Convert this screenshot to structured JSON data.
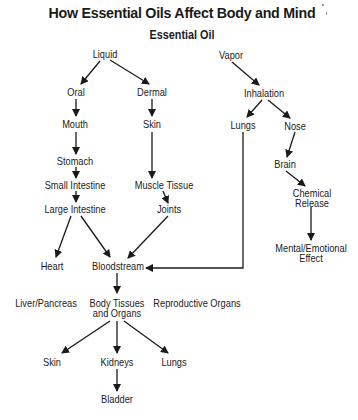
{
  "title": "How Essential Oils Affect Body and Mind",
  "subtitle": "Essential Oil",
  "nodes": {
    "liquid": "Liquid",
    "vapor": "Vapor",
    "oral": "Oral",
    "dermal": "Dermal",
    "inhalation": "Inhalation",
    "mouth": "Mouth",
    "skin_dermal": "Skin",
    "lungs_inhalation": "Lungs",
    "nose": "Nose",
    "stomach": "Stomach",
    "brain": "Brain",
    "small_intestine": "Small Intestine",
    "muscle_tissue": "Muscle Tissue",
    "large_intestine": "Large Intestine",
    "joints": "Joints",
    "chemical_release_1": "Chemical",
    "chemical_release_2": "Release",
    "mental_effect_1": "Mental/Emotional",
    "mental_effect_2": "Effect",
    "heart": "Heart",
    "bloodstream": "Bloodstream",
    "liver_pancreas": "Liver/Pancreas",
    "body_tissues_1": "Body Tissues",
    "body_tissues_2": "and Organs",
    "reproductive_organs": "Reproductive Organs",
    "skin_output": "Skin",
    "kidneys": "Kidneys",
    "lungs_output": "Lungs",
    "bladder": "Bladder"
  },
  "edges": [
    [
      "Liquid",
      "Oral"
    ],
    [
      "Liquid",
      "Dermal"
    ],
    [
      "Vapor",
      "Inhalation"
    ],
    [
      "Oral",
      "Mouth"
    ],
    [
      "Dermal",
      "Skin"
    ],
    [
      "Inhalation",
      "Lungs"
    ],
    [
      "Inhalation",
      "Nose"
    ],
    [
      "Mouth",
      "Stomach"
    ],
    [
      "Skin",
      "Muscle Tissue"
    ],
    [
      "Nose",
      "Brain"
    ],
    [
      "Stomach",
      "Small Intestine"
    ],
    [
      "Small Intestine",
      "Large Intestine"
    ],
    [
      "Muscle Tissue",
      "Joints"
    ],
    [
      "Brain",
      "Chemical Release"
    ],
    [
      "Chemical Release",
      "Mental/Emotional Effect"
    ],
    [
      "Large Intestine",
      "Heart"
    ],
    [
      "Large Intestine",
      "Bloodstream"
    ],
    [
      "Joints",
      "Bloodstream"
    ],
    [
      "Lungs",
      "Bloodstream"
    ],
    [
      "Bloodstream",
      "Body Tissues and Organs"
    ],
    [
      "Body Tissues and Organs",
      "Skin"
    ],
    [
      "Body Tissues and Organs",
      "Kidneys"
    ],
    [
      "Body Tissues and Organs",
      "Lungs"
    ],
    [
      "Kidneys",
      "Bladder"
    ]
  ]
}
